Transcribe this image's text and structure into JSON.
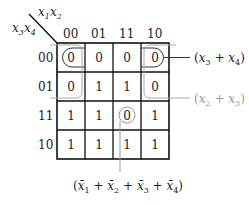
{
  "diagram": {
    "type": "karnaugh-map",
    "corner": {
      "col_vars": [
        "x",
        "1",
        "x",
        "2"
      ],
      "row_vars": [
        "x",
        "3",
        "x",
        "4"
      ]
    },
    "col_headers": [
      "00",
      "01",
      "11",
      "10"
    ],
    "row_headers": [
      "00",
      "01",
      "11",
      "10"
    ],
    "cells": [
      [
        "0",
        "0",
        "0",
        "0"
      ],
      [
        "0",
        "1",
        "1",
        "0"
      ],
      [
        "1",
        "1",
        "0",
        "1"
      ],
      [
        "1",
        "1",
        "1",
        "1"
      ]
    ],
    "groups": [
      {
        "id": "g1",
        "label_parts": [
          "(",
          "x",
          "3",
          " + ",
          "x",
          "4",
          ")"
        ],
        "text": "(x3 + x4)",
        "color": "#222222"
      },
      {
        "id": "g2",
        "label_parts": [
          "(",
          "x",
          "2",
          " + ",
          "x",
          "3",
          ")"
        ],
        "text": "(x2 + x3)",
        "color": "#9a9a9a"
      },
      {
        "id": "g3",
        "text": "(x̄1 + x̄2 + x̄3 + x̄4)",
        "color": "#222222"
      }
    ],
    "bottom_label": {
      "terms": [
        {
          "v": "x̄",
          "s": "1"
        },
        {
          "v": "x̄",
          "s": "2"
        },
        {
          "v": "x̄",
          "s": "3"
        },
        {
          "v": "x̄",
          "s": "4"
        }
      ],
      "plus": "+",
      "open": "(",
      "close": ")"
    }
  }
}
